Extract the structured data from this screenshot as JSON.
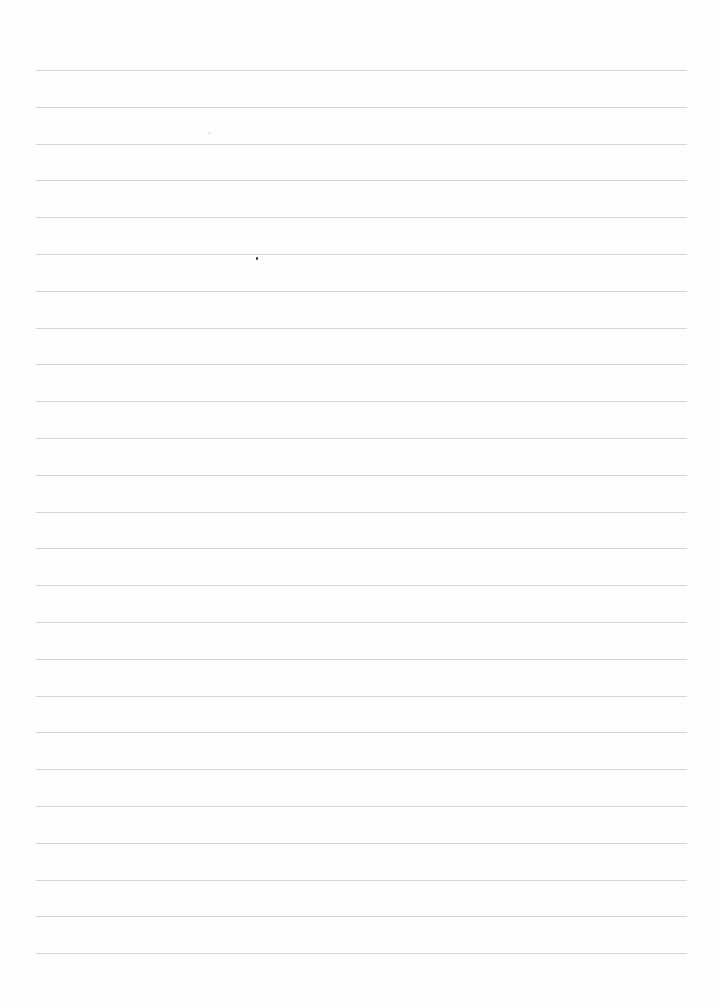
{
  "page": {
    "type": "lined-paper",
    "background_color": "#fefefe",
    "rule_color": "#d6d6d6",
    "rule_count": 25,
    "rule_first_y": 70,
    "rule_spacing": 36.8,
    "rule_left_x": 36,
    "rule_right_x": 687,
    "text_content": ""
  },
  "marks": [
    {
      "x": 256,
      "y": 257,
      "kind": "dot"
    },
    {
      "x": 209,
      "y": 132,
      "kind": "faint-dot"
    }
  ]
}
